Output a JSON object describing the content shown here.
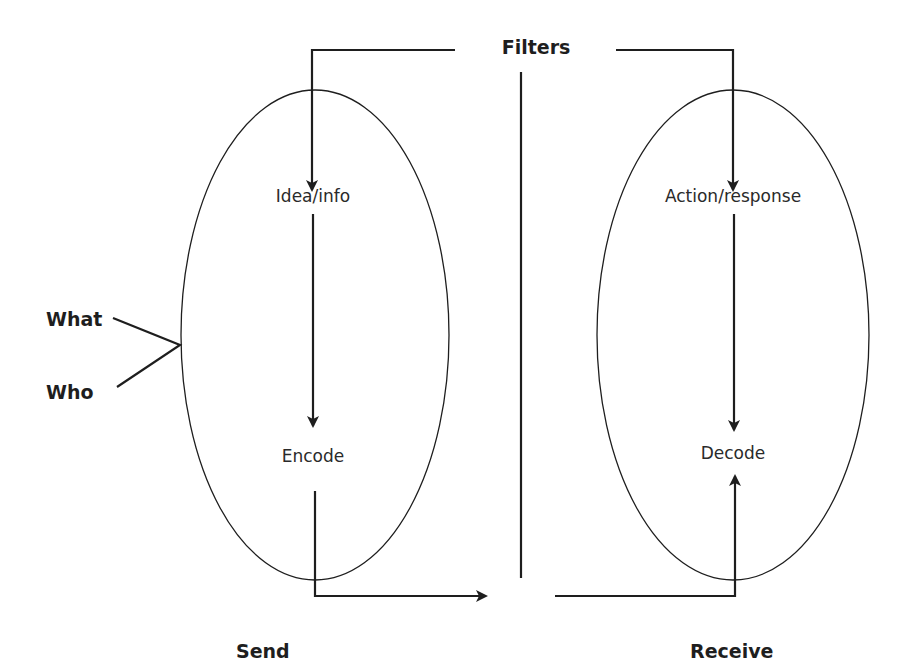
{
  "diagram": {
    "title_label": "Filters",
    "sender": {
      "label": "Send",
      "nodes": [
        "Idea/info",
        "Encode"
      ],
      "inputs": [
        "What",
        "Who"
      ]
    },
    "receiver": {
      "label": "Receive",
      "nodes": [
        "Action/response",
        "Decode"
      ]
    },
    "colors": {
      "line": "#1e1e1e",
      "background": "#ffffff"
    }
  }
}
